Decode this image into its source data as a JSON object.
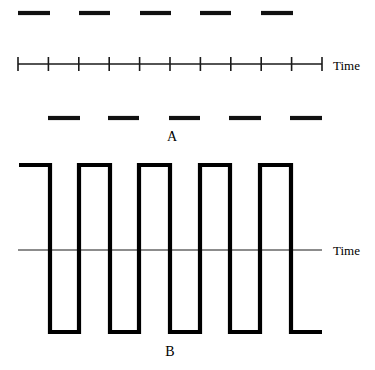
{
  "figure": {
    "title": "",
    "background_color": "#ffffff",
    "ink_color": "#000000",
    "panels": [
      {
        "id": "A",
        "label": "A",
        "label_x": 172,
        "label_y": 141
      },
      {
        "id": "B",
        "label": "B",
        "label_x": 170,
        "label_y": 356
      }
    ],
    "axis_labels": [
      {
        "id": "time-top",
        "text": "Time",
        "x": 333,
        "y": 70
      },
      {
        "id": "time-bottom",
        "text": "Time",
        "x": 333,
        "y": 255
      }
    ]
  },
  "chart_data": {
    "type": "line",
    "xlabel": "Time",
    "ylabel": "",
    "grid": false,
    "legend": "none",
    "panels": [
      {
        "name": "A",
        "label": "A",
        "description": "Two dashed pulse trains plotted above and below a ticked time axis",
        "time_axis": {
          "label": "Time",
          "x_start": 18,
          "x_end": 322,
          "y": 64,
          "tick_count": 11,
          "tick_spacing": 30.4,
          "tick_half_height": 7,
          "tick_positions": [
            18,
            48.4,
            78.8,
            109.2,
            139.6,
            170,
            200.4,
            230.8,
            261.2,
            291.6,
            322
          ]
        },
        "series": [
          {
            "name": "upper-pulse-train",
            "y": 13,
            "dash_count": 5,
            "segments": [
              {
                "x1": 18,
                "x2": 50
              },
              {
                "x1": 79,
                "x2": 110
              },
              {
                "x1": 140,
                "x2": 171
              },
              {
                "x1": 200,
                "x2": 231
              },
              {
                "x1": 261,
                "x2": 293
              }
            ]
          },
          {
            "name": "lower-pulse-train",
            "y": 118,
            "dash_count": 5,
            "segments": [
              {
                "x1": 48,
                "x2": 80
              },
              {
                "x1": 108,
                "x2": 139
              },
              {
                "x1": 169,
                "x2": 200
              },
              {
                "x1": 229,
                "x2": 261
              },
              {
                "x1": 290,
                "x2": 322
              }
            ]
          }
        ]
      },
      {
        "name": "B",
        "label": "B",
        "description": "Bipolar square wave of five cycles about a zero baseline",
        "baseline": {
          "label": "Time",
          "x_start": 18,
          "x_end": 322,
          "y": 250
        },
        "waveform": {
          "name": "square-wave",
          "high_y": 165,
          "low_y": 332,
          "start_x": 19,
          "end_x": 322,
          "cycles": 5,
          "period": 60.5,
          "duty_cycle": 0.5,
          "initial_level": "high",
          "transitions": [
            50,
            79,
            110,
            139,
            170,
            200,
            230,
            260,
            291,
            291
          ],
          "points": [
            [
              19,
              165
            ],
            [
              50,
              165
            ],
            [
              50,
              332
            ],
            [
              79,
              332
            ],
            [
              79,
              165
            ],
            [
              110,
              165
            ],
            [
              110,
              332
            ],
            [
              139,
              332
            ],
            [
              139,
              165
            ],
            [
              170,
              165
            ],
            [
              170,
              332
            ],
            [
              200,
              332
            ],
            [
              200,
              165
            ],
            [
              230,
              165
            ],
            [
              230,
              332
            ],
            [
              260,
              332
            ],
            [
              260,
              165
            ],
            [
              291,
              165
            ],
            [
              291,
              332
            ],
            [
              322,
              332
            ]
          ]
        }
      }
    ]
  }
}
